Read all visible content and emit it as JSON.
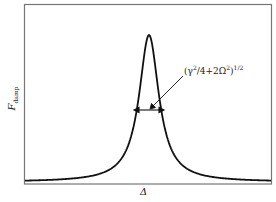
{
  "chart_data": {
    "type": "line",
    "title": "",
    "xlabel": "Δ",
    "ylabel": "F_damp",
    "ylabel_main": "F",
    "ylabel_sub": "damp",
    "grid": false,
    "legend": null,
    "ticks": {
      "x": [],
      "y": []
    },
    "series": [
      {
        "name": "Lorentzian damping force",
        "shape": "lorentzian",
        "center": 0.0,
        "peak": 1.0,
        "baseline": 0.02
      }
    ],
    "annotations": [
      {
        "text": "(γ²/4+2Ω²)^(1/2)",
        "text_base": "(γ",
        "text_sup1": "2",
        "text_mid": "/4+2Ω",
        "text_sup2": "2",
        "text_end": ")",
        "text_sup3": "1/2",
        "type": "width-arrow",
        "description": "double-headed arrow marking the peak width"
      }
    ],
    "colors": {
      "line": "#111111",
      "frame": "#777777",
      "text": "#222222"
    }
  }
}
